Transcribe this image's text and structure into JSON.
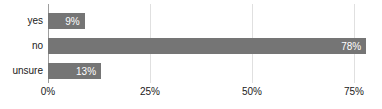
{
  "chart_data": {
    "type": "bar",
    "orientation": "horizontal",
    "title": "",
    "categories": [
      "yes",
      "no",
      "unsure"
    ],
    "values": [
      9,
      78,
      13
    ],
    "value_labels": [
      "9%",
      "78%",
      "13%"
    ],
    "x_ticks": [
      {
        "value": 0,
        "label": "0%"
      },
      {
        "value": 25,
        "label": "25%"
      },
      {
        "value": 50,
        "label": "50%"
      },
      {
        "value": 75,
        "label": "75%"
      }
    ],
    "xlim": [
      0,
      82
    ],
    "grid": true,
    "legend": "none",
    "colors": {
      "bar": "#757575",
      "gridline": "#e0e0e0",
      "axis_line": "#9e9e9e",
      "category_label": "#212121",
      "tick_label": "#212121",
      "value_label": "#ffffff"
    }
  }
}
